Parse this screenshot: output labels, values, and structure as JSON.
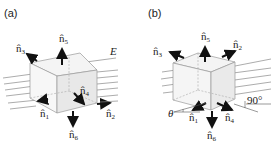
{
  "panels": [
    {
      "id": "a",
      "label": "(a)",
      "normals": [
        {
          "name": "n1",
          "hat": "n̂",
          "sub": "1"
        },
        {
          "name": "n2",
          "hat": "n̂",
          "sub": "2"
        },
        {
          "name": "n3",
          "hat": "n̂",
          "sub": "3"
        },
        {
          "name": "n4",
          "hat": "n̂",
          "sub": "4"
        },
        {
          "name": "n5",
          "hat": "n̂",
          "sub": "5"
        },
        {
          "name": "n6",
          "hat": "n̂",
          "sub": "6"
        }
      ],
      "field_label": "E⃗"
    },
    {
      "id": "b",
      "label": "(b)",
      "normals": [
        {
          "name": "n1",
          "hat": "n̂",
          "sub": "1"
        },
        {
          "name": "n2",
          "hat": "n̂",
          "sub": "2"
        },
        {
          "name": "n3",
          "hat": "n̂",
          "sub": "3"
        },
        {
          "name": "n4",
          "hat": "n̂",
          "sub": "4"
        },
        {
          "name": "n5",
          "hat": "n̂",
          "sub": "5"
        },
        {
          "name": "n6",
          "hat": "n̂",
          "sub": "6"
        }
      ],
      "angle_theta": "θ",
      "angle_right": "90°"
    }
  ],
  "colors": {
    "ink": "#111111",
    "field_line": "#777777",
    "face_fill": "#eeeeee",
    "edge": "#999999"
  }
}
